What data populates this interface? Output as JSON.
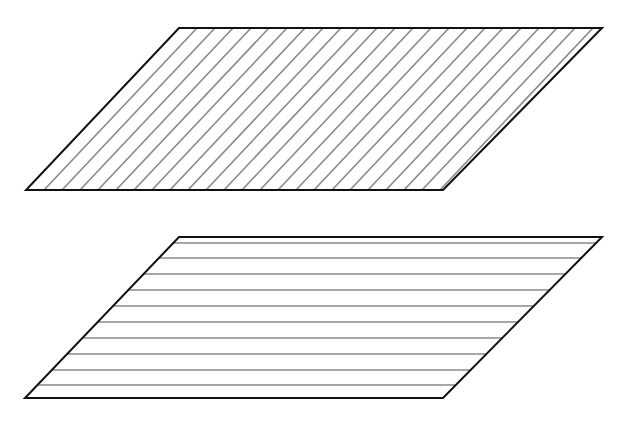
{
  "figure": {
    "width": 627,
    "height": 424,
    "background": "#ffffff",
    "outline_color": "#111111",
    "outline_width": 2,
    "hatch_color": "#8a8a8a",
    "hatch_width": 1.6
  },
  "shapes": [
    {
      "name": "diagonal-hatched-parallelogram",
      "vertices": {
        "top_left": [
          179,
          28
        ],
        "top_right": [
          602,
          28
        ],
        "bottom_right": [
          443,
          190
        ],
        "bottom_left": [
          26,
          190
        ]
      },
      "hatch": {
        "direction": "diagonal",
        "description": "parallel to slanted sides",
        "spacing_px": 18,
        "count": 23
      }
    },
    {
      "name": "horizontal-hatched-parallelogram",
      "vertices": {
        "top_left": [
          179,
          237
        ],
        "top_right": [
          602,
          237
        ],
        "bottom_right": [
          443,
          398
        ],
        "bottom_left": [
          25,
          398
        ]
      },
      "hatch": {
        "direction": "horizontal",
        "description": "parallel to top and bottom edges",
        "line_y": [
          243,
          258,
          274,
          290,
          306,
          322,
          338,
          354,
          370,
          385
        ],
        "count": 10
      }
    }
  ]
}
